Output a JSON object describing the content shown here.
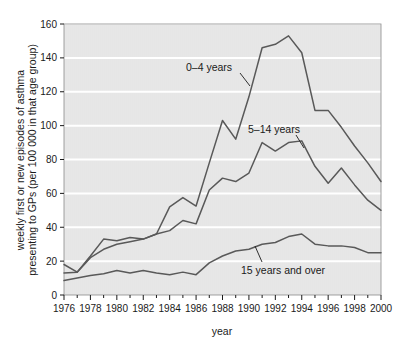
{
  "chart_data": {
    "type": "line",
    "title": "",
    "xlabel": "year",
    "ylabel_line1": "weekly first or new episodes of asthma",
    "ylabel_line2": "presenting to GPs (per 100 000 in that age group)",
    "xlim": [
      1976,
      2000
    ],
    "ylim": [
      0,
      160
    ],
    "ytick_values": [
      0,
      20,
      40,
      60,
      80,
      100,
      120,
      140,
      160
    ],
    "ytick_labels": [
      "0",
      "20",
      "40",
      "60",
      "80",
      "100",
      "120",
      "140",
      "160"
    ],
    "xtick_values": [
      1976,
      1978,
      1980,
      1982,
      1984,
      1986,
      1988,
      1990,
      1992,
      1994,
      1996,
      1998,
      2000
    ],
    "xtick_labels": [
      "1976",
      "1978",
      "1980",
      "1982",
      "1984",
      "1986",
      "1988",
      "1990",
      "1992",
      "1994",
      "1996",
      "1998",
      "2000"
    ],
    "minor_xticks_every": 1,
    "grid": "horizontal-white",
    "legend": "inline-annotations",
    "plot_background": "#e8e8e8",
    "gridline_color": "#ffffff",
    "line_color": "#595959",
    "x": [
      1976,
      1977,
      1978,
      1979,
      1980,
      1981,
      1982,
      1983,
      1984,
      1985,
      1986,
      1987,
      1988,
      1989,
      1990,
      1991,
      1992,
      1993,
      1994,
      1995,
      1996,
      1997,
      1998,
      1999,
      2000
    ],
    "series": [
      {
        "name": "0–4 years",
        "label": "0–4 years",
        "values": [
          13,
          13.5,
          23,
          33,
          32,
          34,
          33,
          36,
          52,
          57.5,
          52.5,
          78,
          103,
          92,
          117,
          146,
          148,
          153,
          143,
          109,
          109,
          99,
          88,
          78,
          67
        ]
      },
      {
        "name": "5–14 years",
        "label": "5–14 years",
        "values": [
          18,
          13.5,
          22,
          27,
          30,
          31.5,
          33,
          36,
          38,
          44,
          42,
          62,
          69,
          67,
          72,
          90,
          85,
          90,
          91,
          76,
          66,
          75,
          65,
          56,
          50
        ]
      },
      {
        "name": "15 years and over",
        "label": "15 years and over",
        "values": [
          8.5,
          10,
          11.5,
          12.5,
          14.5,
          13,
          14.5,
          13,
          12,
          13.5,
          12,
          19,
          23,
          26,
          27,
          30,
          31,
          34.5,
          36,
          30,
          29,
          29,
          28,
          25,
          25
        ]
      }
    ]
  }
}
